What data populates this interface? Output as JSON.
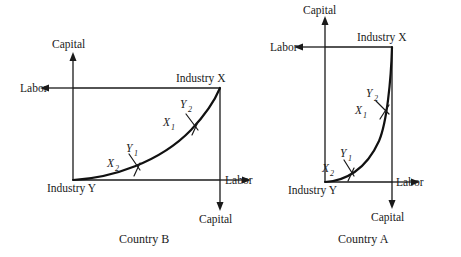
{
  "figure": {
    "type": "economics-diagram"
  },
  "panels": [
    {
      "id": "country-b",
      "caption": "Country B",
      "origin_bottom_left_label": "Industry Y",
      "origin_top_right_label": "Industry X",
      "axes": {
        "top_left_vertical": "Capital",
        "top_left_horizontal": "Labor",
        "bottom_right_horizontal": "Labor",
        "bottom_right_vertical": "Capital"
      },
      "box": {
        "x": 73,
        "y": 88,
        "width": 147,
        "height": 92
      },
      "tangency_points": [
        {
          "id": "lower",
          "x_label": "X",
          "x_sub": "2",
          "y_label": "Y",
          "y_sub": "1",
          "px": 135,
          "py": 163
        },
        {
          "id": "upper",
          "x_label": "X",
          "x_sub": "1",
          "y_label": "Y",
          "y_sub": "2",
          "px": 192,
          "py": 122
        }
      ],
      "curve": {
        "shape": "convex-increasing",
        "from": [
          73,
          180
        ],
        "to": [
          220,
          88
        ]
      }
    },
    {
      "id": "country-a",
      "caption": "Country A",
      "origin_bottom_left_label": "Industry Y",
      "origin_top_right_label": "Industry X",
      "axes": {
        "top_left_vertical": "Capital",
        "top_left_horizontal": "Labor",
        "bottom_right_horizontal": "Labor",
        "bottom_right_vertical": "Capital"
      },
      "box": {
        "x": 325,
        "y": 47,
        "width": 67,
        "height": 135
      },
      "tangency_points": [
        {
          "id": "lower",
          "x_label": "X",
          "x_sub": "2",
          "y_label": "Y",
          "y_sub": "1",
          "px": 348,
          "py": 168
        },
        {
          "id": "upper",
          "x_label": "X",
          "x_sub": "1",
          "y_label": "Y",
          "y_sub": "2",
          "px": 382,
          "py": 108
        }
      ],
      "curve": {
        "shape": "convex-increasing-steep",
        "from": [
          325,
          182
        ],
        "to": [
          392,
          47
        ]
      }
    }
  ],
  "colors": {
    "background": "#ffffff",
    "ink": "#1a1a1a",
    "curve": "#111111"
  }
}
